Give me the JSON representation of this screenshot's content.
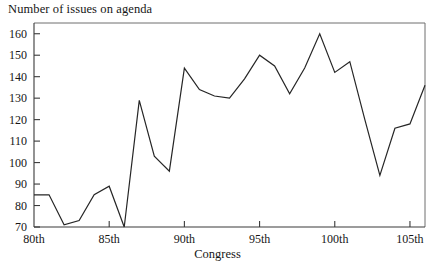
{
  "chart_data": {
    "type": "line",
    "title": "",
    "ylabel": "Number of issues on agenda",
    "xlabel": "Congress",
    "ylim": [
      70,
      165
    ],
    "yticks": [
      70,
      80,
      90,
      100,
      110,
      120,
      130,
      140,
      150,
      160
    ],
    "ytick_labels": [
      "70",
      "80",
      "90",
      "100",
      "110",
      "120",
      "130",
      "140",
      "150",
      "160"
    ],
    "xlim": [
      80,
      106
    ],
    "xticks": [
      80,
      85,
      90,
      95,
      100,
      105
    ],
    "xtick_labels": [
      "80th",
      "85th",
      "90th",
      "95th",
      "100th",
      "105th"
    ],
    "grid": false,
    "legend": null,
    "series": [
      {
        "name": "Number of issues on agenda",
        "color": "#262626",
        "x": [
          80,
          81,
          82,
          83,
          84,
          85,
          86,
          87,
          88,
          89,
          90,
          91,
          92,
          93,
          94,
          95,
          96,
          97,
          98,
          99,
          100,
          101,
          102,
          103,
          104,
          105,
          106
        ],
        "values": [
          85,
          85,
          71,
          73,
          85,
          89,
          70,
          129,
          103,
          96,
          144,
          134,
          131,
          130,
          139,
          150,
          145,
          132,
          144,
          160,
          142,
          147,
          120,
          94,
          116,
          118,
          136
        ]
      }
    ]
  },
  "labels": {
    "y_axis_title": "Number of issues on agenda",
    "x_axis_title": "Congress"
  }
}
